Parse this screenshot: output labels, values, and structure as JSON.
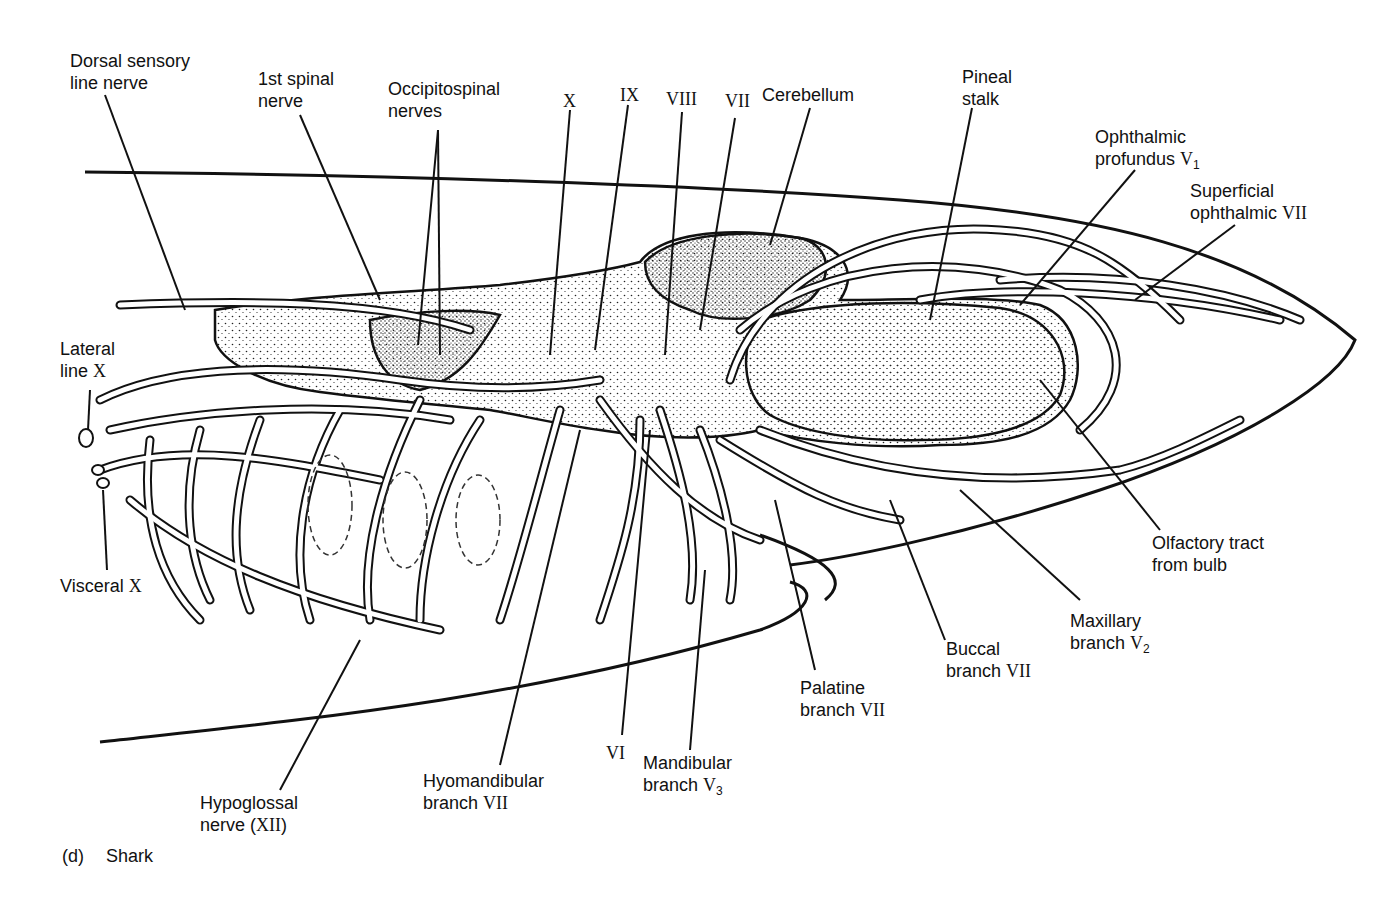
{
  "figure": {
    "caption_letter": "(d)",
    "caption_title": "Shark"
  },
  "labels": {
    "dorsal_sensory": [
      "Dorsal sensory",
      "line nerve"
    ],
    "first_spinal": [
      "1st spinal",
      "nerve"
    ],
    "occipitospinal": [
      "Occipitospinal",
      "nerves"
    ],
    "x": "X",
    "ix": "IX",
    "viii": "VIII",
    "vii": "VII",
    "cerebellum": "Cerebellum",
    "pineal": [
      "Pineal",
      "stalk"
    ],
    "ophthalmic_profundus": [
      "Ophthalmic",
      "profundus",
      "V",
      "1"
    ],
    "superficial_ophthalmic": [
      "Superficial",
      "ophthalmic",
      "VII"
    ],
    "lateral_line": [
      "Lateral",
      "line",
      "X"
    ],
    "visceral": [
      "Visceral",
      "X"
    ],
    "olfactory": [
      "Olfactory tract",
      "from bulb"
    ],
    "maxillary": [
      "Maxillary",
      "branch",
      "V",
      "2"
    ],
    "buccal": [
      "Buccal",
      "branch",
      "VII"
    ],
    "palatine": [
      "Palatine",
      "branch",
      "VII"
    ],
    "mandibular": [
      "Mandibular",
      "branch",
      "V",
      "3"
    ],
    "vi": "VI",
    "hyomandibular": [
      "Hyomandibular",
      "branch",
      "VII"
    ],
    "hypoglossal": [
      "Hypoglossal",
      "nerve (",
      "XII",
      ")"
    ]
  }
}
